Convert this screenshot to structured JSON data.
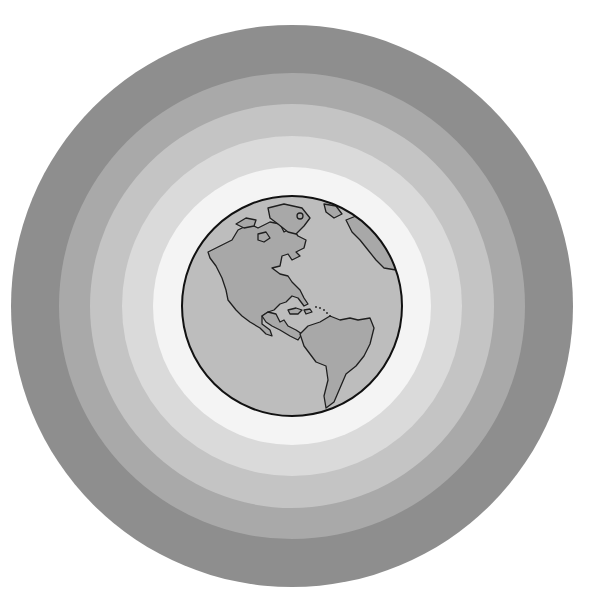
{
  "illustration": {
    "subject": "Earth globe (Americas view) surrounded by concentric gray atmospheric rings",
    "center": [
      292,
      306
    ],
    "rings": [
      {
        "name": "ring-outer",
        "radius": 281,
        "color": "#8e8e8e"
      },
      {
        "name": "ring-2",
        "radius": 233,
        "color": "#a9a9a9"
      },
      {
        "name": "ring-3",
        "radius": 202,
        "color": "#c4c4c4"
      },
      {
        "name": "ring-4",
        "radius": 170,
        "color": "#dadada"
      },
      {
        "name": "ring-5",
        "radius": 139,
        "color": "#f4f4f4"
      }
    ],
    "globe": {
      "radius": 110,
      "ocean_color": "#bdbdbd",
      "land_color": "#a8a8a8",
      "outline_color": "#1a1a1a"
    }
  }
}
